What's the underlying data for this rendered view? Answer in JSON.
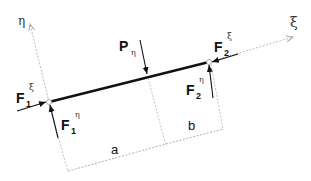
{
  "diagram": {
    "type": "beam free-body diagram",
    "axes": {
      "eta": "η",
      "xi": "ξ"
    },
    "load": {
      "label": "P",
      "sub": "η"
    },
    "forces": {
      "F1_xi": {
        "label": "F",
        "sub": "1",
        "sup": "ξ"
      },
      "F1_eta": {
        "label": "F",
        "sub": "1",
        "sup": "η"
      },
      "F2_xi": {
        "label": "F",
        "sub": "2",
        "sup": "ξ"
      },
      "F2_eta": {
        "label": "F",
        "sub": "2",
        "sup": "η"
      }
    },
    "dimensions": {
      "a": "a",
      "b": "b"
    },
    "colors": {
      "beam": "#111111",
      "axis": "#aaaaaa",
      "dim": "#999999"
    }
  }
}
